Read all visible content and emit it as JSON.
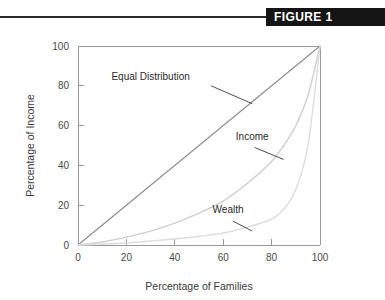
{
  "header": {
    "figure_label": "FIGURE 1",
    "banner_color": "#151515",
    "banner_text_color": "#ffffff",
    "rule_color": "#2b2b2b"
  },
  "chart_data": {
    "type": "line",
    "title": "",
    "subtitle": "",
    "xlabel": "Percentage of Families",
    "ylabel": "Percentage of Income",
    "xlim": [
      0,
      100
    ],
    "ylim": [
      0,
      100
    ],
    "xticks": [
      "0",
      "20",
      "40",
      "60",
      "80",
      "100"
    ],
    "yticks": [
      "0",
      "20",
      "40",
      "60",
      "80",
      "100"
    ],
    "xtick_values": [
      0,
      20,
      40,
      60,
      80,
      100
    ],
    "ytick_values": [
      0,
      20,
      40,
      60,
      80,
      100
    ],
    "grid": false,
    "legend": "none",
    "annotations_as_labels": true,
    "series": [
      {
        "name": "Equal Distribution",
        "color": "#8c8c8c",
        "width": 1.1,
        "x": [
          0,
          10,
          20,
          30,
          40,
          50,
          60,
          70,
          80,
          90,
          100
        ],
        "values": [
          0,
          10,
          20,
          30,
          40,
          50,
          60,
          70,
          80,
          90,
          100
        ]
      },
      {
        "name": "Income",
        "color": "#cfcfcf",
        "width": 1.4,
        "x": [
          0,
          10,
          20,
          30,
          40,
          50,
          60,
          70,
          80,
          85,
          90,
          95,
          100
        ],
        "values": [
          0,
          1.5,
          4,
          7,
          11,
          16,
          22,
          31,
          42,
          50,
          60,
          75,
          100
        ]
      },
      {
        "name": "Wealth",
        "color": "#dcdcdc",
        "width": 1.4,
        "x": [
          0,
          10,
          20,
          30,
          40,
          50,
          60,
          70,
          80,
          85,
          90,
          95,
          100
        ],
        "values": [
          0,
          0.4,
          1,
          2,
          3,
          4.3,
          6,
          9,
          13,
          18,
          28,
          50,
          100
        ]
      }
    ],
    "annotations": [
      {
        "text": "Equal Distribution",
        "label_x": 30,
        "label_y": 83,
        "leader_from_x": 55,
        "leader_from_y": 80,
        "leader_to_x": 72,
        "leader_to_y": 71
      },
      {
        "text": "Income",
        "label_x": 72,
        "label_y": 53,
        "leader_from_x": 73,
        "leader_from_y": 49,
        "leader_to_x": 85,
        "leader_to_y": 43
      },
      {
        "text": "Wealth",
        "label_x": 62,
        "label_y": 16,
        "leader_from_x": 64,
        "leader_from_y": 12,
        "leader_to_x": 72,
        "leader_to_y": 7
      }
    ],
    "axis_color": "#9a9a9a",
    "tick_label_color": "#4a4a4a"
  }
}
